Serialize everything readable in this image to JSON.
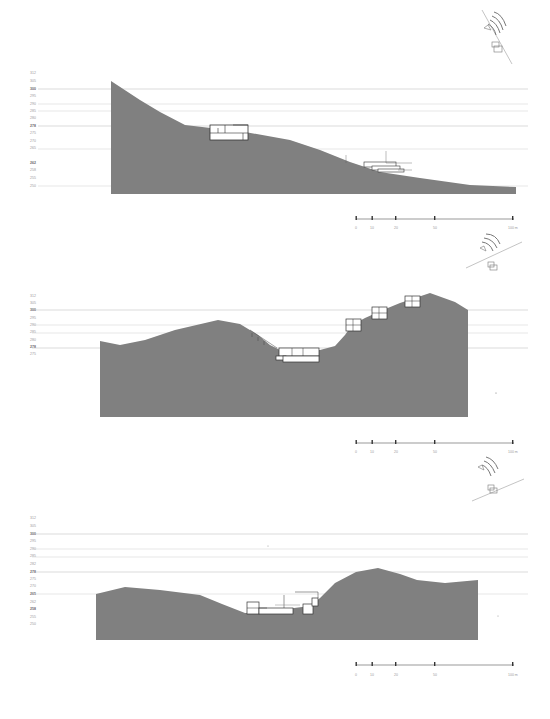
{
  "drawing": {
    "type": "site-sections",
    "ground_fill": "#808080",
    "gridline_color": "#cfcfcf",
    "gridline_strong_color": "#b5b5b5",
    "building_outline_color": "#333333"
  },
  "sections": [
    {
      "id": "section-1",
      "elevation_labels": [
        "312",
        "305",
        "300",
        "295",
        "290",
        "285",
        "280",
        "278",
        "275",
        "270",
        "265",
        "262",
        "258",
        "255",
        "250"
      ],
      "scale_bar": {
        "ticks": [
          "0",
          "10",
          "20",
          "50",
          "100 m"
        ]
      }
    },
    {
      "id": "section-2",
      "elevation_labels": [
        "312",
        "305",
        "300",
        "295",
        "290",
        "285",
        "280",
        "278",
        "275"
      ],
      "scale_bar": {
        "ticks": [
          "0",
          "10",
          "20",
          "50",
          "100 m"
        ]
      }
    },
    {
      "id": "section-3",
      "elevation_labels": [
        "312",
        "305",
        "300",
        "295",
        "290",
        "285",
        "282",
        "278",
        "275",
        "270",
        "265",
        "262",
        "258",
        "255",
        "250"
      ],
      "scale_bar": {
        "ticks": [
          "0",
          "10",
          "20",
          "50",
          "100 m"
        ]
      }
    }
  ]
}
